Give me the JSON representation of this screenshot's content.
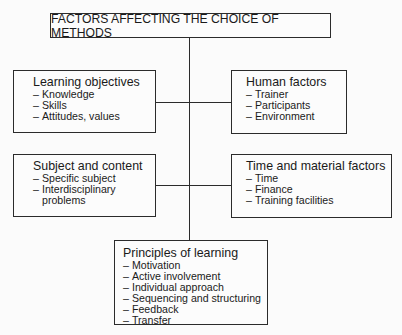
{
  "title": "FACTORS AFFECTING THE CHOICE OF METHODS",
  "boxes": {
    "learning_objectives": {
      "heading": "Learning objectives",
      "items": [
        "Knowledge",
        "Skills",
        "Attitudes, values"
      ]
    },
    "human_factors": {
      "heading": "Human factors",
      "items": [
        "Trainer",
        "Participants",
        "Environment"
      ]
    },
    "subject_content": {
      "heading": "Subject and content",
      "items": [
        "Specific subject",
        "Interdisciplinary",
        "problems"
      ]
    },
    "time_material": {
      "heading": "Time and material factors",
      "items": [
        "Time",
        "Finance",
        "Training facilities"
      ]
    },
    "principles_learning": {
      "heading": "Principles of learning",
      "items": [
        "Motivation",
        "Active involvement",
        "Individual approach",
        "Sequencing and structuring",
        "Feedback",
        "Transfer"
      ]
    }
  },
  "dash": "–"
}
